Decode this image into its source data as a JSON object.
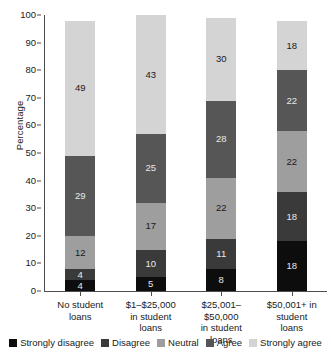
{
  "chart_data": {
    "type": "bar",
    "subtype": "stacked-vertical",
    "title": "",
    "xlabel": "",
    "ylabel": "Percentage",
    "ylim": [
      0,
      100
    ],
    "yticks": [
      0,
      10,
      20,
      30,
      40,
      50,
      60,
      70,
      80,
      90,
      100
    ],
    "grid": false,
    "legend_position": "bottom",
    "stack_order": "bottom-to-top",
    "categories": [
      "No student loans",
      "$1–$25,000 in student loans",
      "$25,001–$50,000 in student loans",
      "$50,001+ in student loans"
    ],
    "category_lines": [
      [
        "No student",
        "loans"
      ],
      [
        "$1–$25,000",
        "in student",
        "loans"
      ],
      [
        "$25,001–",
        "$50,000",
        "in student",
        "loans"
      ],
      [
        "$50,001+ in",
        "student",
        "loans"
      ]
    ],
    "series": [
      {
        "name": "Strongly disagree",
        "color": "#0d0d0d",
        "values": [
          4,
          5,
          8,
          18
        ]
      },
      {
        "name": "Disagree",
        "color": "#3a3a3a",
        "values": [
          4,
          10,
          11,
          18
        ]
      },
      {
        "name": "Neutral",
        "color": "#9e9e9e",
        "values": [
          12,
          17,
          22,
          22
        ]
      },
      {
        "name": "Agree",
        "color": "#565656",
        "values": [
          29,
          25,
          28,
          22
        ]
      },
      {
        "name": "Strongly agree",
        "color": "#d4d4d4",
        "values": [
          49,
          43,
          30,
          18
        ]
      }
    ],
    "totals": [
      98,
      100,
      99,
      98
    ],
    "label_colors": {
      "on_dark": "#e8e8e8",
      "on_light": "#1a1a1a"
    }
  },
  "axis": {
    "y_title": "Percentage"
  }
}
